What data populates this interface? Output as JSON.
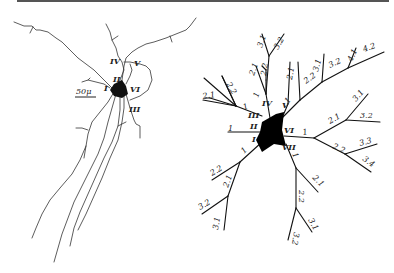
{
  "figure": {
    "left_panel": {
      "title": "neuron-drawing",
      "scale_bar": "50μ",
      "dendrite_labels": [
        "I",
        "II",
        "III",
        "IV",
        "V",
        "VI"
      ]
    },
    "right_panel": {
      "title": "dendrogram",
      "stem_labels": [
        "I",
        "II",
        "III",
        "IV",
        "V",
        "VI",
        "VII"
      ],
      "branch_labels": {
        "upper_left": [
          "1",
          "2.1",
          "2.2"
        ],
        "upper_mid": [
          "1",
          "2.1",
          "2.2",
          "3.1",
          "3.2"
        ],
        "upper_right": [
          "1",
          "2.1",
          "2.2",
          "3.1",
          "3.2",
          "4.1",
          "4.2"
        ],
        "right": [
          "1",
          "2.1",
          "2.2",
          "3.1",
          "3.2",
          "3.3",
          "3.4"
        ],
        "lower_left": [
          "1",
          "2.1",
          "2.2",
          "3.1",
          "3.2"
        ],
        "lower_right": [
          "1",
          "2.1",
          "2.2",
          "3.1",
          "3.2"
        ],
        "left": [
          "1"
        ],
        "other": [
          "1"
        ]
      }
    }
  }
}
